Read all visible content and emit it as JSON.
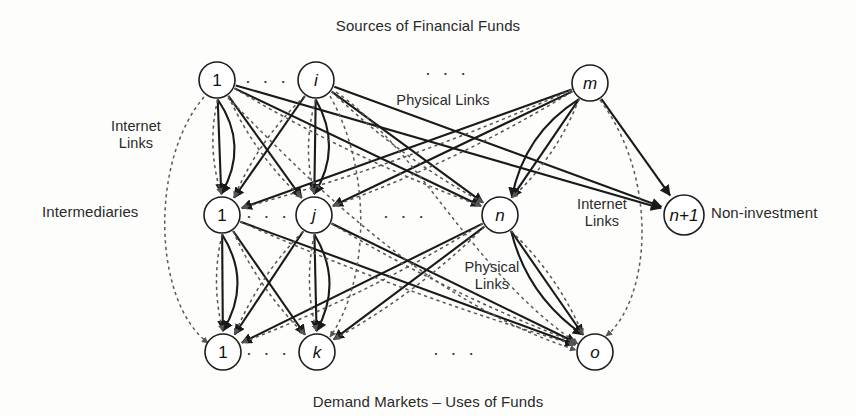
{
  "figure": {
    "title_top": "Sources of Financial Funds",
    "title_bottom": "Demand Markets – Uses of Funds",
    "row_label_intermediaries": "Intermediaries",
    "label_non_investment": "Non-investment",
    "label_internet_links_left": "Internet Links",
    "label_internet_links_right": "Internet Links",
    "label_physical_links_top": "Physical Links",
    "label_physical_links_middle": "Physical Links",
    "ellipsis": "· · ·",
    "colors": {
      "ink": "#1d1d1d",
      "background": "#fdfdfc",
      "node_fill": "#ffffff",
      "solid_link": "#1a1a1a",
      "dotted_link": "#5a5a5a"
    }
  },
  "chart_data": {
    "type": "diagram",
    "title": "Sources of Financial Funds",
    "subtitle": "Demand Markets – Uses of Funds",
    "layers": [
      {
        "name": "sources",
        "label": "Sources of Financial Funds",
        "y": 80,
        "nodes": [
          {
            "id": "s1",
            "label": "1",
            "italic": false,
            "x": 217,
            "y": 80,
            "r": 18
          },
          {
            "id": "si",
            "label": "i",
            "italic": true,
            "x": 316,
            "y": 80,
            "r": 18
          },
          {
            "id": "sm",
            "label": "m",
            "italic": true,
            "x": 590,
            "y": 83,
            "r": 18
          }
        ],
        "ellipses": [
          {
            "x": 267,
            "y": 80
          },
          {
            "x": 447,
            "y": 72
          }
        ]
      },
      {
        "name": "intermediaries",
        "label": "Intermediaries",
        "y": 215,
        "nodes": [
          {
            "id": "m1",
            "label": "1",
            "italic": false,
            "x": 222,
            "y": 215,
            "r": 18
          },
          {
            "id": "mj",
            "label": "j",
            "italic": true,
            "x": 314,
            "y": 215,
            "r": 18
          },
          {
            "id": "mn",
            "label": "n",
            "italic": true,
            "x": 500,
            "y": 215,
            "r": 18
          },
          {
            "id": "mn1",
            "label": "n+1",
            "italic": true,
            "x": 684,
            "y": 215,
            "r": 20
          }
        ],
        "ellipses": [
          {
            "x": 268,
            "y": 215
          },
          {
            "x": 405,
            "y": 215
          }
        ]
      },
      {
        "name": "demand_markets",
        "label": "Demand Markets – Uses of Funds",
        "y": 352,
        "nodes": [
          {
            "id": "d1",
            "label": "1",
            "italic": false,
            "x": 223,
            "y": 352,
            "r": 18
          },
          {
            "id": "dk",
            "label": "k",
            "italic": true,
            "x": 317,
            "y": 352,
            "r": 18
          },
          {
            "id": "do",
            "label": "o",
            "italic": true,
            "x": 595,
            "y": 352,
            "r": 18
          }
        ],
        "ellipses": [
          {
            "x": 268,
            "y": 352
          },
          {
            "x": 455,
            "y": 352
          }
        ]
      }
    ],
    "link_types": [
      {
        "name": "physical",
        "style": "solid",
        "label": "Physical Links"
      },
      {
        "name": "internet",
        "style": "dotted",
        "label": "Internet Links"
      }
    ],
    "annotations": [
      {
        "text": "Internet Links",
        "x": 133,
        "y": 135
      },
      {
        "text": "Physical Links",
        "x": 443,
        "y": 100
      },
      {
        "text": "Physical Links",
        "x": 492,
        "y": 276
      },
      {
        "text": "Internet Links",
        "x": 602,
        "y": 213
      },
      {
        "text": "Non-investment",
        "x": 782,
        "y": 213
      }
    ]
  }
}
